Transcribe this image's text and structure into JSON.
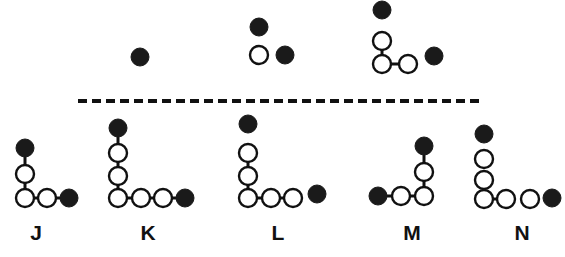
{
  "figure": {
    "width": 565,
    "height": 257,
    "background_color": "#ffffff",
    "stroke_color": "#111111",
    "filled_atom_color": "#1a1a1a",
    "open_atom_fill": "#ffffff"
  },
  "divider": {
    "name": "dashed-divider",
    "x1": 78,
    "x2": 481,
    "y": 101,
    "dash_length": 9,
    "dash_gap": 5,
    "thickness": 4,
    "color": "#111111"
  },
  "top_structures": [
    {
      "id": "top-1",
      "label": "",
      "atoms": [
        {
          "name": "atom-filled",
          "type": "filled",
          "x": 140,
          "y": 57,
          "r": 9
        }
      ],
      "bonds": []
    },
    {
      "id": "top-2",
      "label": "",
      "atoms": [
        {
          "name": "atom-filled",
          "type": "filled",
          "x": 259,
          "y": 27,
          "r": 9
        },
        {
          "name": "atom-open",
          "type": "open",
          "x": 259,
          "y": 55,
          "r": 9
        },
        {
          "name": "atom-filled",
          "type": "filled",
          "x": 285,
          "y": 55,
          "r": 9
        }
      ],
      "bonds": []
    },
    {
      "id": "top-3",
      "label": "",
      "atoms": [
        {
          "name": "atom-filled",
          "type": "filled",
          "x": 382,
          "y": 10,
          "r": 9
        },
        {
          "name": "atom-open",
          "type": "open",
          "x": 382,
          "y": 41,
          "r": 9
        },
        {
          "name": "atom-open",
          "type": "open",
          "x": 382,
          "y": 64,
          "r": 9
        },
        {
          "name": "atom-open",
          "type": "open",
          "x": 408,
          "y": 64,
          "r": 9
        },
        {
          "name": "atom-filled",
          "type": "filled",
          "x": 434,
          "y": 56,
          "r": 9
        }
      ],
      "bonds": [
        {
          "from": 1,
          "to": 2
        },
        {
          "from": 2,
          "to": 3
        }
      ]
    }
  ],
  "bottom_structures": [
    {
      "id": "J",
      "label": "J",
      "label_x": 36,
      "label_y": 232,
      "atoms": [
        {
          "name": "atom-filled",
          "type": "filled",
          "x": 25,
          "y": 148,
          "r": 9
        },
        {
          "name": "atom-open",
          "type": "open",
          "x": 25,
          "y": 174,
          "r": 9
        },
        {
          "name": "atom-open",
          "type": "open",
          "x": 25,
          "y": 198,
          "r": 9
        },
        {
          "name": "atom-open",
          "type": "open",
          "x": 47,
          "y": 198,
          "r": 9
        },
        {
          "name": "atom-filled",
          "type": "filled",
          "x": 69,
          "y": 198,
          "r": 9
        }
      ],
      "bonds": [
        {
          "from": 0,
          "to": 1
        },
        {
          "from": 1,
          "to": 2
        },
        {
          "from": 2,
          "to": 3
        },
        {
          "from": 3,
          "to": 4
        }
      ]
    },
    {
      "id": "K",
      "label": "K",
      "label_x": 148,
      "label_y": 232,
      "atoms": [
        {
          "name": "atom-filled",
          "type": "filled",
          "x": 118,
          "y": 128,
          "r": 9
        },
        {
          "name": "atom-open",
          "type": "open",
          "x": 118,
          "y": 153,
          "r": 9
        },
        {
          "name": "atom-open",
          "type": "open",
          "x": 118,
          "y": 176,
          "r": 9
        },
        {
          "name": "atom-open",
          "type": "open",
          "x": 118,
          "y": 198,
          "r": 9
        },
        {
          "name": "atom-open",
          "type": "open",
          "x": 141,
          "y": 198,
          "r": 9
        },
        {
          "name": "atom-open",
          "type": "open",
          "x": 163,
          "y": 198,
          "r": 9
        },
        {
          "name": "atom-filled",
          "type": "filled",
          "x": 185,
          "y": 198,
          "r": 9
        }
      ],
      "bonds": [
        {
          "from": 0,
          "to": 1
        },
        {
          "from": 1,
          "to": 2
        },
        {
          "from": 2,
          "to": 3
        },
        {
          "from": 3,
          "to": 4
        },
        {
          "from": 4,
          "to": 5
        },
        {
          "from": 5,
          "to": 6
        }
      ]
    },
    {
      "id": "L",
      "label": "L",
      "label_x": 278,
      "label_y": 232,
      "atoms": [
        {
          "name": "atom-filled",
          "type": "filled",
          "x": 248,
          "y": 124,
          "r": 9
        },
        {
          "name": "atom-open",
          "type": "open",
          "x": 248,
          "y": 153,
          "r": 9
        },
        {
          "name": "atom-open",
          "type": "open",
          "x": 248,
          "y": 176,
          "r": 9
        },
        {
          "name": "atom-open",
          "type": "open",
          "x": 248,
          "y": 198,
          "r": 9
        },
        {
          "name": "atom-open",
          "type": "open",
          "x": 271,
          "y": 198,
          "r": 9
        },
        {
          "name": "atom-open",
          "type": "open",
          "x": 293,
          "y": 198,
          "r": 9
        },
        {
          "name": "atom-filled",
          "type": "filled",
          "x": 317,
          "y": 194,
          "r": 9
        }
      ],
      "bonds": [
        {
          "from": 1,
          "to": 2
        },
        {
          "from": 2,
          "to": 3
        },
        {
          "from": 3,
          "to": 4
        },
        {
          "from": 4,
          "to": 5
        }
      ]
    },
    {
      "id": "M",
      "label": "M",
      "label_x": 412,
      "label_y": 232,
      "atoms": [
        {
          "name": "atom-filled",
          "type": "filled",
          "x": 424,
          "y": 146,
          "r": 9
        },
        {
          "name": "atom-open",
          "type": "open",
          "x": 424,
          "y": 172,
          "r": 9
        },
        {
          "name": "atom-open",
          "type": "open",
          "x": 424,
          "y": 196,
          "r": 9
        },
        {
          "name": "atom-open",
          "type": "open",
          "x": 401,
          "y": 196,
          "r": 9
        },
        {
          "name": "atom-filled",
          "type": "filled",
          "x": 378,
          "y": 196,
          "r": 9
        }
      ],
      "bonds": [
        {
          "from": 0,
          "to": 1
        },
        {
          "from": 1,
          "to": 2
        },
        {
          "from": 2,
          "to": 3
        },
        {
          "from": 3,
          "to": 4
        }
      ]
    },
    {
      "id": "N",
      "label": "N",
      "label_x": 522,
      "label_y": 232,
      "atoms": [
        {
          "name": "atom-filled",
          "type": "filled",
          "x": 484,
          "y": 134,
          "r": 9
        },
        {
          "name": "atom-open",
          "type": "open",
          "x": 484,
          "y": 159,
          "r": 9
        },
        {
          "name": "atom-open",
          "type": "open",
          "x": 484,
          "y": 180,
          "r": 9
        },
        {
          "name": "atom-open",
          "type": "open",
          "x": 484,
          "y": 199,
          "r": 9
        },
        {
          "name": "atom-open",
          "type": "open",
          "x": 506,
          "y": 199,
          "r": 9
        },
        {
          "name": "atom-open",
          "type": "open",
          "x": 530,
          "y": 199,
          "r": 9
        },
        {
          "name": "atom-filled",
          "type": "filled",
          "x": 552,
          "y": 198,
          "r": 9
        }
      ],
      "bonds": [
        {
          "from": 2,
          "to": 3
        },
        {
          "from": 3,
          "to": 4
        }
      ]
    }
  ]
}
